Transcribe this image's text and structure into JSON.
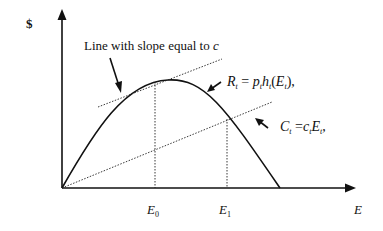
{
  "diagram": {
    "y_axis_label": "$",
    "x_axis_label": "E",
    "annotations": {
      "tangent_label": "Line with slope equal to ",
      "tangent_label_var": "c",
      "revenue_eq": {
        "R": "R",
        "sub": "t",
        "eq": " = ",
        "p": "p",
        "h": "h",
        "open": "(",
        "E": "E",
        "close": "),"
      },
      "cost_eq": {
        "C": "C",
        "sub": "t",
        "eq": " =",
        "c": "c",
        "E": "E",
        "close": ","
      }
    },
    "x_ticks": {
      "e0": "E",
      "e0_sub": "0",
      "e1": "E",
      "e1_sub": "1"
    },
    "colors": {
      "ink": "#111111",
      "background": "#ffffff"
    }
  }
}
